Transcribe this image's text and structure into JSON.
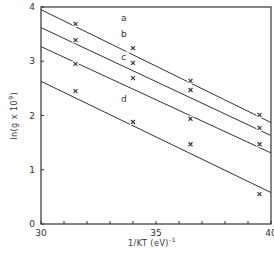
{
  "chart_data": {
    "type": "line",
    "title": "",
    "xlabel": "1/KT (eV)^-1",
    "ylabel": "ln(g x 10^9)",
    "xlim": [
      30,
      40
    ],
    "ylim": [
      0,
      4
    ],
    "x_ticks": [
      30,
      35,
      40
    ],
    "x_minor_ticks": [
      31,
      32,
      33,
      34,
      36,
      37,
      38,
      39
    ],
    "y_ticks": [
      0,
      1,
      2,
      3,
      4
    ],
    "grid": false,
    "legend": "inline line labels a, b, c, d",
    "series": [
      {
        "name": "a",
        "points": [
          {
            "x": 31.5,
            "y": 3.69
          },
          {
            "x": 34.0,
            "y": 3.24
          },
          {
            "x": 36.5,
            "y": 2.64
          },
          {
            "x": 39.5,
            "y": 2.01
          }
        ],
        "fit": {
          "x0": 30,
          "y0": 3.95,
          "x1": 40,
          "y1": 1.87
        },
        "label_pos": {
          "x": 33.6,
          "y": 3.75
        }
      },
      {
        "name": "b",
        "points": [
          {
            "x": 31.5,
            "y": 3.39
          },
          {
            "x": 34.0,
            "y": 2.97
          },
          {
            "x": 36.5,
            "y": 2.47
          },
          {
            "x": 39.5,
            "y": 1.77
          }
        ],
        "fit": {
          "x0": 30,
          "y0": 3.62,
          "x1": 40,
          "y1": 1.63
        },
        "label_pos": {
          "x": 33.6,
          "y": 3.45
        }
      },
      {
        "name": "c",
        "points": [
          {
            "x": 31.5,
            "y": 2.95
          },
          {
            "x": 34.0,
            "y": 2.69
          },
          {
            "x": 36.5,
            "y": 1.94
          },
          {
            "x": 39.5,
            "y": 1.47
          }
        ],
        "fit": {
          "x0": 30,
          "y0": 3.27,
          "x1": 40,
          "y1": 1.31
        },
        "label_pos": {
          "x": 33.6,
          "y": 3.03
        }
      },
      {
        "name": "d",
        "points": [
          {
            "x": 31.5,
            "y": 2.45
          },
          {
            "x": 34.0,
            "y": 1.88
          },
          {
            "x": 36.5,
            "y": 1.47
          },
          {
            "x": 39.5,
            "y": 0.55
          }
        ],
        "fit": {
          "x0": 30,
          "y0": 2.63,
          "x1": 40,
          "y1": 0.58
        },
        "label_pos": {
          "x": 33.6,
          "y": 2.25
        }
      }
    ]
  },
  "axes": {
    "ylabel": "ln(g x 10",
    "ylabel_sup": "9",
    "ylabel_close": ")",
    "xlabel": "1/KT (eV)",
    "xlabel_sup": "-1"
  },
  "style": {
    "line_color": "#333333",
    "marker": "x"
  }
}
